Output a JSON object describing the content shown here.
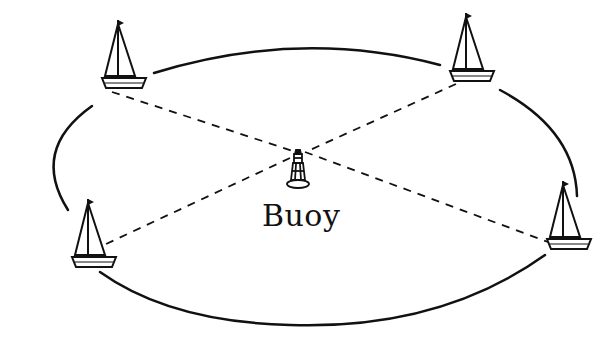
{
  "diagram": {
    "type": "racecourse-layout",
    "center_label": "Buoy",
    "center_marker": "buoy-icon",
    "boats": [
      {
        "id": "boat-top-left",
        "icon": "sailboat-icon"
      },
      {
        "id": "boat-top-right",
        "icon": "sailboat-icon"
      },
      {
        "id": "boat-bottom-left",
        "icon": "sailboat-icon"
      },
      {
        "id": "boat-bottom-right",
        "icon": "sailboat-icon"
      }
    ],
    "course_shape": "ellipse",
    "connector_style": "dashed",
    "colors": {
      "stroke": "#111111",
      "background": "#ffffff"
    }
  }
}
